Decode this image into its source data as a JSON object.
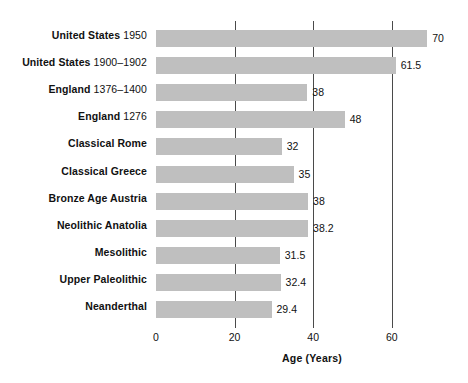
{
  "chart": {
    "background": "#ffffff",
    "bar_color": "#bfbfbf",
    "gridline_color": "#4a4a4a",
    "text_color": "#111111"
  },
  "chart_data": {
    "type": "bar",
    "orientation": "horizontal",
    "title": "",
    "xlabel": "Age (Years)",
    "ylabel": "",
    "xlim": [
      0,
      72
    ],
    "xticks": [
      0,
      20,
      40,
      60
    ],
    "xtick_labels": [
      "0",
      "20",
      "40",
      "60"
    ],
    "grid": "vertical gridlines at 20, 40, 60",
    "legend": "none",
    "categories": [
      "United States 1950",
      "United States 1900–1902",
      "England 1376–1400",
      "England 1276",
      "Classical Rome",
      "Classical Greece",
      "Bronze Age Austria",
      "Neolithic Anatolia",
      "Mesolithic",
      "Upper Paleolithic",
      "Neanderthal"
    ],
    "values": [
      70,
      61.5,
      38,
      48,
      32,
      35,
      38,
      38.2,
      31.5,
      32.4,
      29.4
    ],
    "value_labels": [
      "70",
      "61.5",
      "38",
      "48",
      "32",
      "35",
      "38",
      "38.2",
      "31.5",
      "32.4",
      "29.4"
    ]
  },
  "rows": [
    {
      "place": "United States",
      "date": "1950",
      "value_label": "70",
      "bar_units": 69.0
    },
    {
      "place": "United States",
      "date": "1900–1902",
      "value_label": "61.5",
      "bar_units": 61.0
    },
    {
      "place": "England",
      "date": "1376–1400",
      "value_label": "38",
      "bar_units": 38.5
    },
    {
      "place": "England",
      "date": "1276",
      "value_label": "48",
      "bar_units": 48.0
    },
    {
      "place": "Classical Rome",
      "date": "",
      "value_label": "32",
      "bar_units": 32.0
    },
    {
      "place": "Classical Greece",
      "date": "",
      "value_label": "35",
      "bar_units": 35.0
    },
    {
      "place": "Bronze Age Austria",
      "date": "",
      "value_label": "38",
      "bar_units": 38.7
    },
    {
      "place": "Neolithic Anatolia",
      "date": "",
      "value_label": "38.2",
      "bar_units": 38.7
    },
    {
      "place": "Mesolithic",
      "date": "",
      "value_label": "31.5",
      "bar_units": 31.5
    },
    {
      "place": "Upper Paleolithic",
      "date": "",
      "value_label": "32.4",
      "bar_units": 31.7
    },
    {
      "place": "Neanderthal",
      "date": "",
      "value_label": "29.4",
      "bar_units": 29.4
    }
  ],
  "axis": {
    "title": "Age (Years)",
    "ticks": [
      {
        "label": "0",
        "units": 0
      },
      {
        "label": "20",
        "units": 20
      },
      {
        "label": "40",
        "units": 40
      },
      {
        "label": "60",
        "units": 60
      }
    ],
    "gridlines": [
      20,
      40,
      60
    ]
  }
}
